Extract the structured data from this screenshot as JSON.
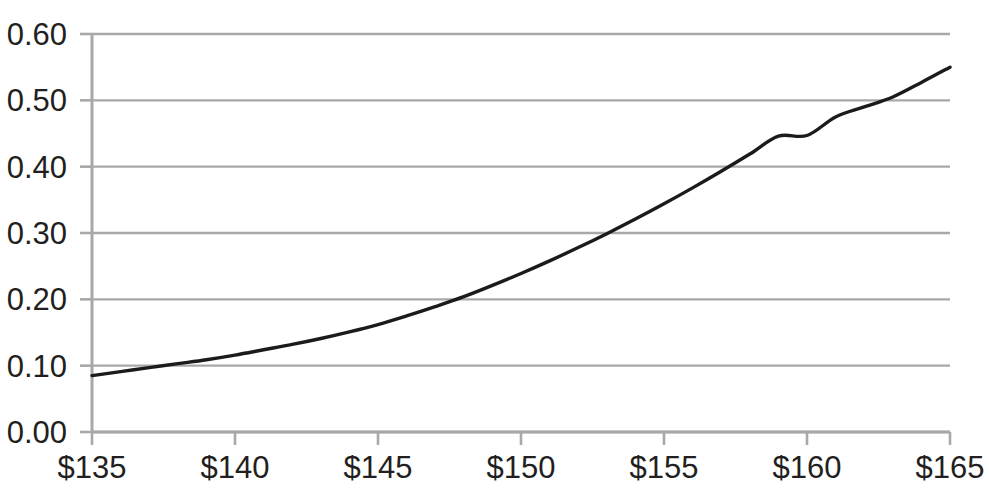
{
  "chart_data": {
    "type": "line",
    "title": "",
    "subtitle": "",
    "xlabel": "",
    "ylabel": "",
    "x": [
      135,
      136,
      137,
      138,
      139,
      140,
      141,
      142,
      143,
      144,
      145,
      146,
      147,
      148,
      149,
      150,
      151,
      152,
      153,
      154,
      155,
      156,
      157,
      158,
      159,
      160,
      161,
      162,
      163,
      164,
      165
    ],
    "values": [
      0.085,
      0.091,
      0.097,
      0.103,
      0.109,
      0.116,
      0.124,
      0.132,
      0.141,
      0.151,
      0.162,
      0.175,
      0.189,
      0.204,
      0.221,
      0.239,
      0.258,
      0.278,
      0.299,
      0.321,
      0.344,
      0.368,
      0.393,
      0.419,
      0.446,
      0.447,
      0.475,
      0.49,
      0.505,
      0.527,
      0.55
    ],
    "series": [
      {
        "name": "curve",
        "color": "#1b1b1b",
        "points": [
          {
            "x": 135,
            "y": 0.085
          },
          {
            "x": 140,
            "y": 0.116
          },
          {
            "x": 145,
            "y": 0.162
          },
          {
            "x": 146.5,
            "y": 0.2
          },
          {
            "x": 150,
            "y": 0.239
          },
          {
            "x": 153.2,
            "y": 0.3
          },
          {
            "x": 155,
            "y": 0.344
          },
          {
            "x": 158.5,
            "y": 0.4
          },
          {
            "x": 160,
            "y": 0.447
          },
          {
            "x": 162.5,
            "y": 0.5
          },
          {
            "x": 165,
            "y": 0.55
          }
        ]
      }
    ],
    "x_ticks": [
      "$135",
      "$140",
      "$145",
      "$150",
      "$155",
      "$160",
      "$165"
    ],
    "x_tick_values": [
      135,
      140,
      145,
      150,
      155,
      160,
      165
    ],
    "y_ticks": [
      "0.60",
      "0.50",
      "0.40",
      "0.30",
      "0.20",
      "0.10",
      "0.00"
    ],
    "y_tick_values": [
      0.6,
      0.5,
      0.4,
      0.3,
      0.2,
      0.1,
      0.0
    ],
    "xlim": [
      135,
      165
    ],
    "ylim": [
      0.0,
      0.6
    ],
    "grid": true,
    "grid_axis": "y",
    "legend": false,
    "legend_position": "none"
  },
  "style": {
    "background_color": "#ffffff",
    "grid_color": "#a8a8a8",
    "axis_color": "#a8a8a8",
    "text_color": "#231f20",
    "line_color": "#1b1b1b"
  }
}
